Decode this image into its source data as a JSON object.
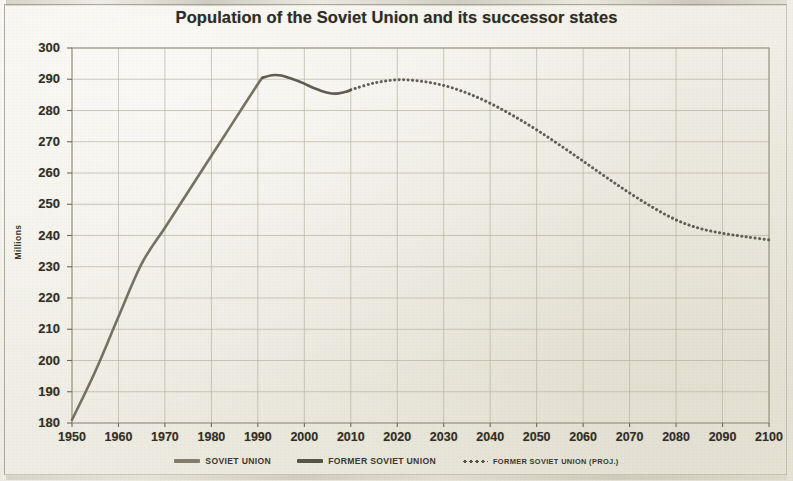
{
  "chart_data": {
    "type": "line",
    "title": "Population of the Soviet Union and its successor states",
    "xlabel": "",
    "ylabel": "Millions",
    "xlim": [
      1950,
      2100
    ],
    "ylim": [
      180,
      300
    ],
    "xticks": [
      1950,
      1960,
      1970,
      1980,
      1990,
      2000,
      2010,
      2020,
      2030,
      2040,
      2050,
      2060,
      2070,
      2080,
      2090,
      2100
    ],
    "yticks": [
      180,
      190,
      200,
      210,
      220,
      230,
      240,
      250,
      260,
      270,
      280,
      290,
      300
    ],
    "grid": true,
    "legend_position": "bottom",
    "series": [
      {
        "name": "Soviet Union",
        "style": "solid",
        "color": "#6e6a5c",
        "x": [
          1950,
          1955,
          1960,
          1965,
          1970,
          1975,
          1980,
          1985,
          1990,
          1991
        ],
        "values": [
          181.0,
          196.5,
          214.0,
          231.0,
          242.5,
          254.0,
          265.5,
          277.0,
          288.5,
          290.5
        ]
      },
      {
        "name": "Former Soviet Union",
        "style": "solid",
        "color": "#56534a",
        "x": [
          1991,
          1993,
          1995,
          1997,
          2000,
          2002,
          2005,
          2007,
          2009,
          2010
        ],
        "values": [
          290.5,
          291.3,
          291.2,
          290.3,
          288.6,
          287.2,
          285.7,
          285.4,
          286.0,
          286.6
        ]
      },
      {
        "name": "Former Soviet Union (proj.)",
        "style": "dotted",
        "color": "#56534a",
        "x": [
          2010,
          2015,
          2020,
          2025,
          2030,
          2035,
          2040,
          2045,
          2050,
          2055,
          2060,
          2065,
          2070,
          2075,
          2080,
          2085,
          2090,
          2095,
          2100
        ],
        "values": [
          286.6,
          288.8,
          289.8,
          289.4,
          288.0,
          285.6,
          282.3,
          278.3,
          273.8,
          268.9,
          263.8,
          258.6,
          253.6,
          249.0,
          245.0,
          242.3,
          240.7,
          239.6,
          238.6
        ]
      }
    ]
  },
  "legend": [
    {
      "label": "Soviet Union",
      "swatch": "solid",
      "color": "#817d6d"
    },
    {
      "label": "Former Soviet Union",
      "swatch": "solid",
      "color": "#56534a"
    },
    {
      "label": "Former Soviet Union (proj.)",
      "swatch": "dotted",
      "color": "#56534a"
    }
  ],
  "colors": {
    "paper": "#f1efe6",
    "ink": "#332f27",
    "grid": "#b9b4a3",
    "line_soviet": "#817d6d",
    "line_former": "#56534a"
  }
}
